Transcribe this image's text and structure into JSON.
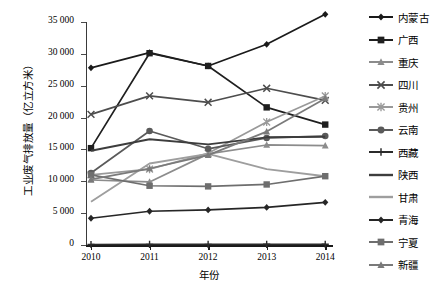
{
  "chart_data": {
    "type": "line",
    "title": "",
    "xlabel": "年份",
    "ylabel": "工业废气排放量（亿立方米）",
    "categories": [
      "2010",
      "2011",
      "2012",
      "2013",
      "2014"
    ],
    "x_tick_labels": [
      "2010",
      "2011",
      "2012",
      "2013",
      "2014"
    ],
    "y_tick_labels": [
      "0",
      "5 000",
      "10 000",
      "15 000",
      "20 000",
      "25 000",
      "30 000",
      "35 000"
    ],
    "y_tick_values": [
      0,
      5000,
      10000,
      15000,
      20000,
      25000,
      30000,
      35000
    ],
    "ylim": [
      0,
      35000
    ],
    "grid": false,
    "legend_position": "right",
    "series": [
      {
        "name": "内蒙古",
        "marker": "diamond",
        "color": "#1a1a1a",
        "values": [
          27800,
          30200,
          28100,
          31500,
          36200
        ]
      },
      {
        "name": "广西",
        "marker": "square",
        "color": "#1f1f1f",
        "values": [
          15200,
          30100,
          28100,
          21600,
          18900
        ]
      },
      {
        "name": "重庆",
        "marker": "triangle",
        "color": "#8c8c8c",
        "values": [
          10200,
          9900,
          14300,
          15700,
          15600
        ]
      },
      {
        "name": "四川",
        "marker": "cross",
        "color": "#4d4d4d",
        "values": [
          20500,
          23400,
          22400,
          24600,
          22700
        ]
      },
      {
        "name": "贵州",
        "marker": "star",
        "color": "#999999",
        "values": [
          11000,
          11900,
          14400,
          19300,
          23400
        ]
      },
      {
        "name": "云南",
        "marker": "circle",
        "color": "#5a5a5a",
        "values": [
          11300,
          17900,
          15100,
          16800,
          17100
        ]
      },
      {
        "name": "西藏",
        "marker": "plus",
        "color": "#2b2b2b",
        "values": [
          80,
          90,
          100,
          110,
          120
        ]
      },
      {
        "name": "陕西",
        "marker": "none",
        "color": "#3d3d3d",
        "values": [
          14800,
          16600,
          15800,
          16900,
          17000
        ]
      },
      {
        "name": "甘肃",
        "marker": "none",
        "color": "#9e9e9e",
        "values": [
          6800,
          12800,
          14300,
          11900,
          10800
        ]
      },
      {
        "name": "青海",
        "marker": "diamond",
        "color": "#262626",
        "values": [
          4200,
          5300,
          5500,
          5900,
          6700
        ]
      },
      {
        "name": "宁夏",
        "marker": "square",
        "color": "#6e6e6e",
        "values": [
          11000,
          9300,
          9200,
          9500,
          10800
        ]
      },
      {
        "name": "新疆",
        "marker": "triangle",
        "color": "#7a7a7a",
        "values": [
          10300,
          12000,
          14100,
          17800,
          23000
        ]
      }
    ]
  },
  "legend": {
    "items": [
      {
        "label": "内蒙古"
      },
      {
        "label": "广西"
      },
      {
        "label": "重庆"
      },
      {
        "label": "四川"
      },
      {
        "label": "贵州"
      },
      {
        "label": "云南"
      },
      {
        "label": "西藏"
      },
      {
        "label": "陕西"
      },
      {
        "label": "甘肃"
      },
      {
        "label": "青海"
      },
      {
        "label": "宁夏"
      },
      {
        "label": "新疆"
      }
    ]
  }
}
